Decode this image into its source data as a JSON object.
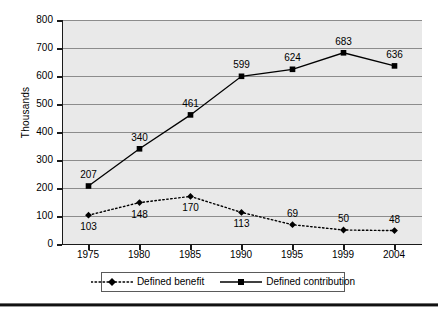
{
  "chart_data": {
    "type": "line",
    "title": "",
    "xlabel": "",
    "ylabel": "Thousands",
    "categories": [
      "1975",
      "1980",
      "1985",
      "1990",
      "1995",
      "1999",
      "2004"
    ],
    "ylim": [
      0,
      800
    ],
    "ytick_labels": [
      "800",
      "700",
      "600",
      "500",
      "400",
      "300",
      "200",
      "100",
      "0"
    ],
    "ytick_values": [
      800,
      700,
      600,
      500,
      400,
      300,
      200,
      100,
      0
    ],
    "grid": true,
    "legend_position": "bottom",
    "series": [
      {
        "name": "Defined benefit",
        "marker": "diamond",
        "line_style": "dotted",
        "color": "#000000",
        "values": [
          103,
          148,
          170,
          113,
          69,
          50,
          48
        ],
        "labels": [
          "103",
          "148",
          "170",
          "113",
          "69",
          "50",
          "48"
        ],
        "label_positions": [
          "below",
          "below",
          "below",
          "below",
          "above",
          "above",
          "above"
        ]
      },
      {
        "name": "Defined contribution",
        "marker": "square",
        "line_style": "solid",
        "color": "#000000",
        "values": [
          207,
          340,
          461,
          599,
          624,
          683,
          636
        ],
        "labels": [
          "207",
          "340",
          "461",
          "599",
          "624",
          "683",
          "636"
        ],
        "label_positions": [
          "above",
          "above",
          "above",
          "above",
          "above",
          "above",
          "above"
        ]
      }
    ]
  },
  "legend": {
    "items": [
      {
        "label": "Defined benefit",
        "marker": "diamond-icon",
        "style": "dotted"
      },
      {
        "label": "Defined contribution",
        "marker": "square-icon",
        "style": "solid"
      }
    ]
  },
  "colors": {
    "plot_background": "#e9e9e9",
    "gridline": "#8c8c8c",
    "axis": "#1a1a1a",
    "series": "#000000",
    "bottom_rule": "#111111"
  }
}
